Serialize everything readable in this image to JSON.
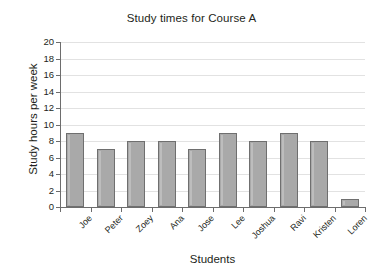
{
  "chart_data": {
    "type": "bar",
    "title": "Study times for Course A",
    "xlabel": "Students",
    "ylabel": "Study hours per week",
    "categories": [
      "Joe",
      "Peter",
      "Zoey",
      "Ana",
      "Jose",
      "Lee",
      "Joshua",
      "Ravi",
      "Kristen",
      "Loren"
    ],
    "values": [
      9,
      7,
      8,
      8,
      7,
      9,
      8,
      9,
      8,
      1
    ],
    "ylim": [
      0,
      20
    ],
    "ytick_step": 2,
    "yticks": [
      0,
      2,
      4,
      6,
      8,
      10,
      12,
      14,
      16,
      18,
      20
    ],
    "ytick_labels": [
      "0",
      "2",
      "4",
      "6",
      "8",
      "10",
      "12",
      "14",
      "16",
      "18",
      "20"
    ],
    "grid": true,
    "grid_axis": "y",
    "legend": false,
    "legend_position": "none",
    "bar_color": "#a9a9a9",
    "bar_edge_color": "#6f6f6f",
    "grid_color": "#e2e2e2",
    "axis_color": "#6d6d6d",
    "background": "#ffffff",
    "text_color": "#231f20"
  }
}
